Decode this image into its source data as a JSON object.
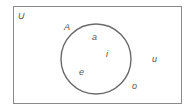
{
  "diagram": {
    "type": "venn",
    "universal_set_label": "U",
    "set_label": "A",
    "inside_elements": [
      "a",
      "i",
      "e"
    ],
    "outside_elements": [
      "u",
      "o"
    ],
    "colors": {
      "stroke": "#777777",
      "circle_stroke": "#666666",
      "text": "#555555"
    }
  }
}
